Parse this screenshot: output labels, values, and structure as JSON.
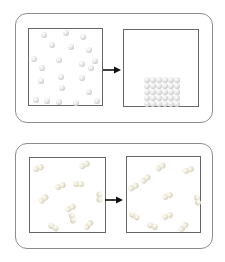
{
  "figure": {
    "kind": "chemistry-particle-diagram",
    "visible_text": [],
    "panels": [
      {
        "name": "top",
        "arrow_icon": "arrow-right",
        "boxes": [
          {
            "type": "atoms",
            "particle_count": 22,
            "particles": [
              [
                15,
                6
              ],
              [
                37,
                4
              ],
              [
                54,
                8
              ],
              [
                23,
                16
              ],
              [
                42,
                18
              ],
              [
                60,
                21
              ],
              [
                5,
                30
              ],
              [
                30,
                31
              ],
              [
                53,
                35
              ],
              [
                66,
                32
              ],
              [
                62,
                39
              ],
              [
                13,
                39
              ],
              [
                32,
                48
              ],
              [
                53,
                49
              ],
              [
                12,
                52
              ],
              [
                33,
                59
              ],
              [
                60,
                63
              ],
              [
                7,
                71
              ],
              [
                18,
                72
              ],
              [
                30,
                73
              ],
              [
                68,
                72
              ],
              [
                47,
                74
              ]
            ]
          },
          {
            "type": "lattice",
            "origin": [
              23,
              50
            ],
            "spacing": 6,
            "cols": 6,
            "rows": 5,
            "particle_count": 30
          }
        ]
      },
      {
        "name": "bottom",
        "arrow_icon": "arrow-right",
        "boxes": [
          {
            "type": "molecules",
            "particle_count": 10,
            "particles": [
              [
                8,
                10,
                -20
              ],
              [
                54,
                7,
                -30
              ],
              [
                30,
                28,
                -25
              ],
              [
                48,
                26,
                0
              ],
              [
                13,
                41,
                -40
              ],
              [
                69,
                39,
                90
              ],
              [
                40,
                50,
                -30
              ],
              [
                42,
                60,
                75
              ],
              [
                23,
                69,
                30
              ],
              [
                58,
                67,
                -45
              ]
            ]
          },
          {
            "type": "molecules",
            "particle_count": 10,
            "particles": [
              [
                33,
                10,
                -35
              ],
              [
                61,
                13,
                -20
              ],
              [
                18,
                22,
                -40
              ],
              [
                6,
                30,
                -30
              ],
              [
                40,
                39,
                -25
              ],
              [
                70,
                43,
                80
              ],
              [
                7,
                59,
                30
              ],
              [
                40,
                59,
                -20
              ],
              [
                25,
                69,
                20
              ],
              [
                56,
                70,
                -45
              ]
            ]
          }
        ]
      }
    ]
  },
  "colors": {
    "background": "#ffffff",
    "panel_border": "#8c8c8c",
    "box_border": "#666666",
    "arrow": "#111111",
    "atom_highlight": "#ffffff",
    "atom_mid": "#e3e3e3",
    "atom_shadow": "#a9a9a9",
    "molecule_highlight": "#fffdf6",
    "molecule_mid": "#eae4d3",
    "molecule_shadow": "#b9b3a0"
  }
}
